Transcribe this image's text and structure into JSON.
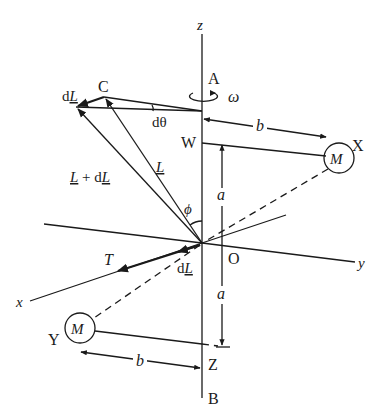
{
  "figure": {
    "type": "physics-diagram",
    "axes": {
      "z": "z",
      "x": "x",
      "y": "y"
    },
    "points": {
      "A": "A",
      "B": "B",
      "C": "C",
      "O": "O",
      "W": "W",
      "X": "X",
      "Y": "Y",
      "Z": "Z"
    },
    "masses": {
      "upper": "M",
      "lower": "M"
    },
    "dimensions": {
      "a_upper": "a",
      "a_lower": "a",
      "b_upper": "b",
      "b_lower": "b"
    },
    "symbols": {
      "omega": "ω",
      "phi": "ϕ",
      "dtheta": "dθ",
      "torque": "T",
      "L_vector_d": "d",
      "L_vector_L": "L",
      "L_plus_dL_L1": "L",
      "L_plus_dL_plus": " + d",
      "L_plus_dL_L2": "L",
      "dL_top_d": "d",
      "dL_top_L": "L",
      "dL_bottom_d": "d",
      "dL_bottom_L": "L"
    }
  }
}
